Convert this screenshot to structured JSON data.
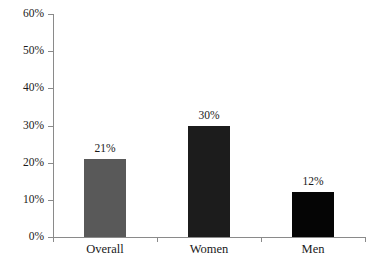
{
  "chart_data": {
    "type": "bar",
    "title": "",
    "xlabel": "",
    "ylabel": "",
    "categories": [
      "Overall",
      "Women",
      "Men"
    ],
    "values": [
      21,
      30,
      12
    ],
    "value_labels": [
      "21%",
      "30%",
      "12%"
    ],
    "bar_colors": [
      "#595959",
      "#1c1c1c",
      "#050505"
    ],
    "ylim": [
      0,
      60
    ],
    "y_tick_values": [
      0,
      10,
      20,
      30,
      40,
      50,
      60
    ],
    "y_tick_labels": [
      "0%",
      "10%",
      "20%",
      "30%",
      "40%",
      "50%",
      "60%"
    ],
    "grid": false,
    "legend": false,
    "legend_position": "none",
    "axis_color": "#8a8a8a",
    "background": "#ffffff",
    "text_color": "#1a1a1a"
  }
}
